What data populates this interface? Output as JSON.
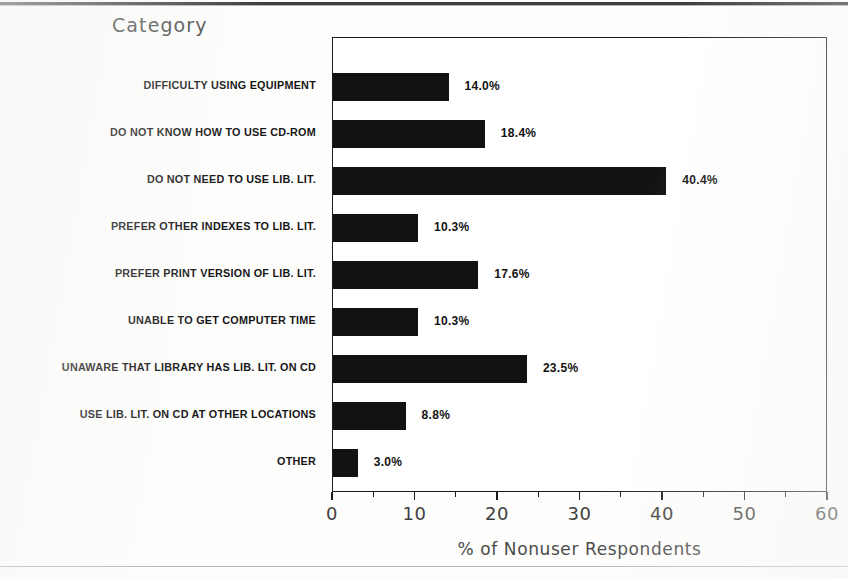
{
  "figure": {
    "category_axis_heading": "Category",
    "xaxis_title": "% of Nonuser Respondents",
    "bar_color": "#121212",
    "frame_color": "#1d1d1d",
    "text_color": "#161616"
  },
  "chart_data": {
    "type": "bar",
    "orientation": "horizontal",
    "title": "",
    "subtitle": "",
    "xlabel": "% of Nonuser Respondents",
    "ylabel": "Category",
    "xlim": [
      0,
      60
    ],
    "xticks": [
      0,
      10,
      20,
      30,
      40,
      50,
      60
    ],
    "xticklabels": [
      "0",
      "10",
      "20",
      "30",
      "40",
      "50",
      "60"
    ],
    "minor_xticks": [
      5,
      15,
      25,
      35,
      45,
      55
    ],
    "grid": false,
    "legend": false,
    "legend_position": "none",
    "value_label_suffix": "%",
    "categories": [
      "DIFFICULTY USING EQUIPMENT",
      "DO NOT KNOW HOW TO USE CD-ROM",
      "DO NOT NEED TO USE LIB. LIT.",
      "PREFER OTHER INDEXES TO LIB. LIT.",
      "PREFER PRINT VERSION OF LIB. LIT.",
      "UNABLE TO GET COMPUTER TIME",
      "UNAWARE THAT LIBRARY HAS LIB. LIT. ON CD",
      "USE LIB. LIT. ON CD AT OTHER LOCATIONS",
      "OTHER"
    ],
    "values": [
      14.0,
      18.4,
      40.4,
      10.3,
      17.6,
      10.3,
      23.5,
      8.8,
      3.0
    ],
    "value_labels": [
      "14.0%",
      "18.4%",
      "40.4%",
      "10.3%",
      "17.6%",
      "10.3%",
      "23.5%",
      "8.8%",
      "3.0%"
    ]
  }
}
